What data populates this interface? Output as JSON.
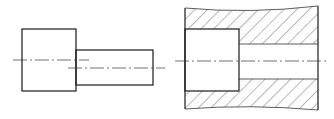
{
  "figure": {
    "title": "",
    "views": [
      {
        "id": "stepped-pin-view",
        "description": "Stepped cylindrical pin, external view with two offset center lines"
      },
      {
        "id": "sectioned-bore-view",
        "description": "Sectioned housing with counterbore and through bore, hatched material, wavy break lines"
      }
    ],
    "colors": {
      "line": "#1a1a1a",
      "background": "#ffffff"
    }
  }
}
